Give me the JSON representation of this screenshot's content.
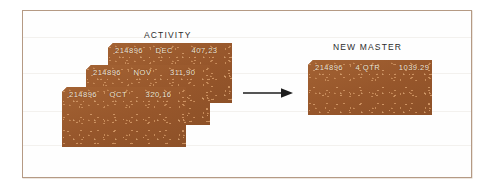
{
  "figure": {
    "frame_border_color": "#b59a84",
    "background_color": "#ffffff",
    "card_color": "#9c5c2f",
    "card_text_color": "#f6ead9"
  },
  "activity_group": {
    "caption": "ACTIVITY",
    "cards": [
      {
        "id": "214896",
        "period": "DEC",
        "amount": "407.23"
      },
      {
        "id": "214896",
        "period": "NOV",
        "amount": "311.90"
      },
      {
        "id": "214896",
        "period": "OCT",
        "amount": "320.16"
      }
    ]
  },
  "flow": {
    "arrow_icon": "arrow-right-icon",
    "direction": "right"
  },
  "new_master_group": {
    "caption": "NEW MASTER",
    "cards": [
      {
        "id": "214896",
        "period": "4 QTR",
        "amount": "1039.29"
      }
    ]
  }
}
